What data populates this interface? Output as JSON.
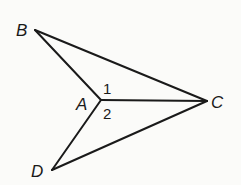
{
  "diagram": {
    "title": "",
    "points": {
      "B": {
        "label": "B",
        "x": 35,
        "y": 30
      },
      "A": {
        "label": "A",
        "x": 101,
        "y": 100
      },
      "C": {
        "label": "C",
        "x": 207,
        "y": 101
      },
      "D": {
        "label": "D",
        "x": 52,
        "y": 170
      }
    },
    "segments": [
      {
        "from": "B",
        "to": "A"
      },
      {
        "from": "B",
        "to": "C"
      },
      {
        "from": "A",
        "to": "C"
      },
      {
        "from": "A",
        "to": "D"
      },
      {
        "from": "D",
        "to": "C"
      }
    ],
    "angles": [
      {
        "label": "1",
        "vertex": "A",
        "between": [
          "B",
          "C"
        ]
      },
      {
        "label": "2",
        "vertex": "A",
        "between": [
          "C",
          "D"
        ]
      }
    ],
    "colors": {
      "line": "#1a1a1a",
      "background": "#fbfbf9"
    }
  }
}
